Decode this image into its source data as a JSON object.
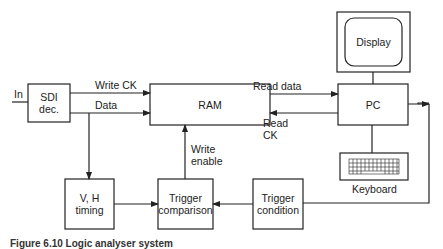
{
  "diagram": {
    "input_label": "In",
    "blocks": {
      "sdi": "SDI dec.",
      "sdi_line1": "SDI",
      "sdi_line2": "dec.",
      "ram": "RAM",
      "pc": "PC",
      "display": "Display",
      "keyboard": "Keyboard",
      "vh_line1": "V, H",
      "vh_line2": "timing",
      "tcomp_line1": "Trigger",
      "tcomp_line2": "comparison",
      "tcond_line1": "Trigger",
      "tcond_line2": "condition"
    },
    "signals": {
      "write_ck": "Write CK",
      "data": "Data",
      "read_data": "Read data",
      "read_ck_line1": "Read",
      "read_ck_line2": "CK",
      "write_enable_line1": "Write",
      "write_enable_line2": "enable"
    },
    "connections": [
      {
        "from": "In",
        "to": "SDI dec."
      },
      {
        "from": "SDI dec.",
        "to": "RAM",
        "label": "Write CK"
      },
      {
        "from": "SDI dec.",
        "to": "RAM",
        "label": "Data"
      },
      {
        "from": "SDI dec.",
        "to": "V, H timing"
      },
      {
        "from": "RAM",
        "to": "PC",
        "label": "Read data"
      },
      {
        "from": "PC",
        "to": "RAM",
        "label": "Read CK"
      },
      {
        "from": "PC",
        "to": "Display"
      },
      {
        "from": "PC",
        "to": "Keyboard"
      },
      {
        "from": "PC",
        "to": "Trigger condition"
      },
      {
        "from": "Trigger condition",
        "to": "Trigger comparison"
      },
      {
        "from": "V, H timing",
        "to": "Trigger comparison"
      },
      {
        "from": "Trigger comparison",
        "to": "RAM",
        "label": "Write enable"
      }
    ]
  },
  "caption": "Figure 6.10  Logic analyser system"
}
